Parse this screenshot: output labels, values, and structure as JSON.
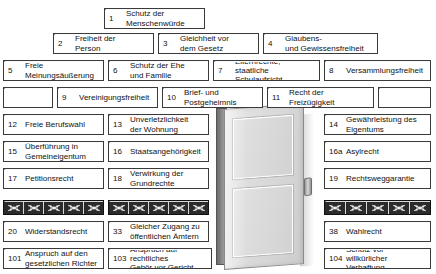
{
  "diagram": {
    "door": {
      "name": "open-door",
      "jamb_color": "#8d8d8d",
      "leaf_color": "#dcdcdc"
    },
    "wire": {
      "label": "barbed-wire course",
      "color": "#2b2b2b",
      "motif": "barbed-wire-bowtie",
      "left_cells": 5,
      "right_cells": 5,
      "center_left_cells": 5,
      "far_right_cells": 5
    },
    "caption": "",
    "rows": [
      {
        "row": 1,
        "bricks": [
          {
            "num": "1",
            "text": "Schutz der\nMenschenwürde",
            "x": 104,
            "y": 8,
            "w": 101,
            "h": 21
          }
        ]
      },
      {
        "row": 2,
        "bricks": [
          {
            "num": "2",
            "text": "Freiheit der\nPerson",
            "x": 53,
            "y": 33,
            "w": 101,
            "h": 21
          },
          {
            "num": "3",
            "text": "Gleichheit vor\ndem Gesetz",
            "x": 158,
            "y": 33,
            "w": 101,
            "h": 21
          },
          {
            "num": "4",
            "text": "Glaubens-\nund Gewissensfreiheit",
            "x": 263,
            "y": 33,
            "w": 115,
            "h": 21
          }
        ]
      },
      {
        "row": 3,
        "bricks": [
          {
            "num": "5",
            "text": "Freie\nMeinungsäußerung",
            "x": 3,
            "y": 60,
            "w": 101,
            "h": 21
          },
          {
            "num": "6",
            "text": "Schutz der Ehe\nund Familie",
            "x": 108,
            "y": 60,
            "w": 101,
            "h": 21
          },
          {
            "num": "7",
            "text": "Elternrechte,\nstaatliche Schulaufsicht",
            "x": 213,
            "y": 60,
            "w": 107,
            "h": 21
          },
          {
            "num": "8",
            "text": "Versammlungsfreiheit",
            "x": 324,
            "y": 60,
            "w": 107,
            "h": 21
          }
        ]
      },
      {
        "row": 4,
        "bricks": [
          {
            "num": "",
            "text": "",
            "x": 3,
            "y": 87,
            "w": 50,
            "h": 21,
            "blank": true
          },
          {
            "num": "9",
            "text": "Vereinigungsfreiheit",
            "x": 57,
            "y": 87,
            "w": 101,
            "h": 21
          },
          {
            "num": "10",
            "text": "Brief- und\nPostgeheimnis",
            "x": 162,
            "y": 87,
            "w": 101,
            "h": 21
          },
          {
            "num": "11",
            "text": "Recht der Freizügigkeit",
            "x": 267,
            "y": 87,
            "w": 107,
            "h": 21
          },
          {
            "num": "",
            "text": "",
            "x": 378,
            "y": 87,
            "w": 53,
            "h": 21,
            "blank": true
          }
        ]
      },
      {
        "row": 5,
        "bricks": [
          {
            "num": "12",
            "text": "Freie Berufswahl",
            "x": 3,
            "y": 114,
            "w": 101,
            "h": 21
          },
          {
            "num": "13",
            "text": "Unverletzlichkeit\nder Wohnung",
            "x": 108,
            "y": 114,
            "w": 101,
            "h": 21
          },
          {
            "num": "14",
            "text": "Gewährleistung des\nEigentums",
            "x": 324,
            "y": 114,
            "w": 107,
            "h": 21
          }
        ]
      },
      {
        "row": 6,
        "bricks": [
          {
            "num": "15",
            "text": "Überführung in\nGemeineigentum",
            "x": 3,
            "y": 141,
            "w": 101,
            "h": 21
          },
          {
            "num": "16",
            "text": "Staatsangehörigkeit",
            "x": 108,
            "y": 141,
            "w": 101,
            "h": 21
          },
          {
            "num": "16a",
            "text": "Asylrecht",
            "x": 324,
            "y": 141,
            "w": 107,
            "h": 21
          }
        ]
      },
      {
        "row": 7,
        "bricks": [
          {
            "num": "17",
            "text": "Petitionsrecht",
            "x": 3,
            "y": 168,
            "w": 101,
            "h": 21
          },
          {
            "num": "18",
            "text": "Verwirkung der\nGrundrechte",
            "x": 108,
            "y": 168,
            "w": 101,
            "h": 21
          },
          {
            "num": "19",
            "text": "Rechtsweggarantie",
            "x": 324,
            "y": 168,
            "w": 107,
            "h": 21
          }
        ]
      },
      {
        "row": 8,
        "wire_blocks": [
          {
            "x": 3,
            "y": 200,
            "w": 101,
            "h": 15,
            "cells": 5
          },
          {
            "x": 108,
            "y": 200,
            "w": 101,
            "h": 15,
            "cells": 5
          },
          {
            "x": 324,
            "y": 200,
            "w": 107,
            "h": 15,
            "cells": 5
          }
        ]
      },
      {
        "row": 9,
        "bricks": [
          {
            "num": "20",
            "text": "Widerstandsrecht",
            "x": 3,
            "y": 221,
            "w": 101,
            "h": 21
          },
          {
            "num": "33",
            "text": "Gleicher Zugang zu\nöffentlichen Ämtern",
            "x": 108,
            "y": 221,
            "w": 101,
            "h": 21
          },
          {
            "num": "38",
            "text": "Wahlrecht",
            "x": 324,
            "y": 221,
            "w": 107,
            "h": 21
          }
        ]
      },
      {
        "row": 10,
        "bricks": [
          {
            "num": "101",
            "text": "Anspruch auf den\ngesetzlichen Richter",
            "x": 3,
            "y": 248,
            "w": 101,
            "h": 21
          },
          {
            "num": "103",
            "text": "Anspruch auf rechtliches\nGehör vor Gericht",
            "x": 108,
            "y": 248,
            "w": 104,
            "h": 21
          },
          {
            "num": "104",
            "text": "Schutz vor\nwillkürlicher Verhaftung",
            "x": 324,
            "y": 248,
            "w": 107,
            "h": 21
          }
        ]
      }
    ]
  }
}
